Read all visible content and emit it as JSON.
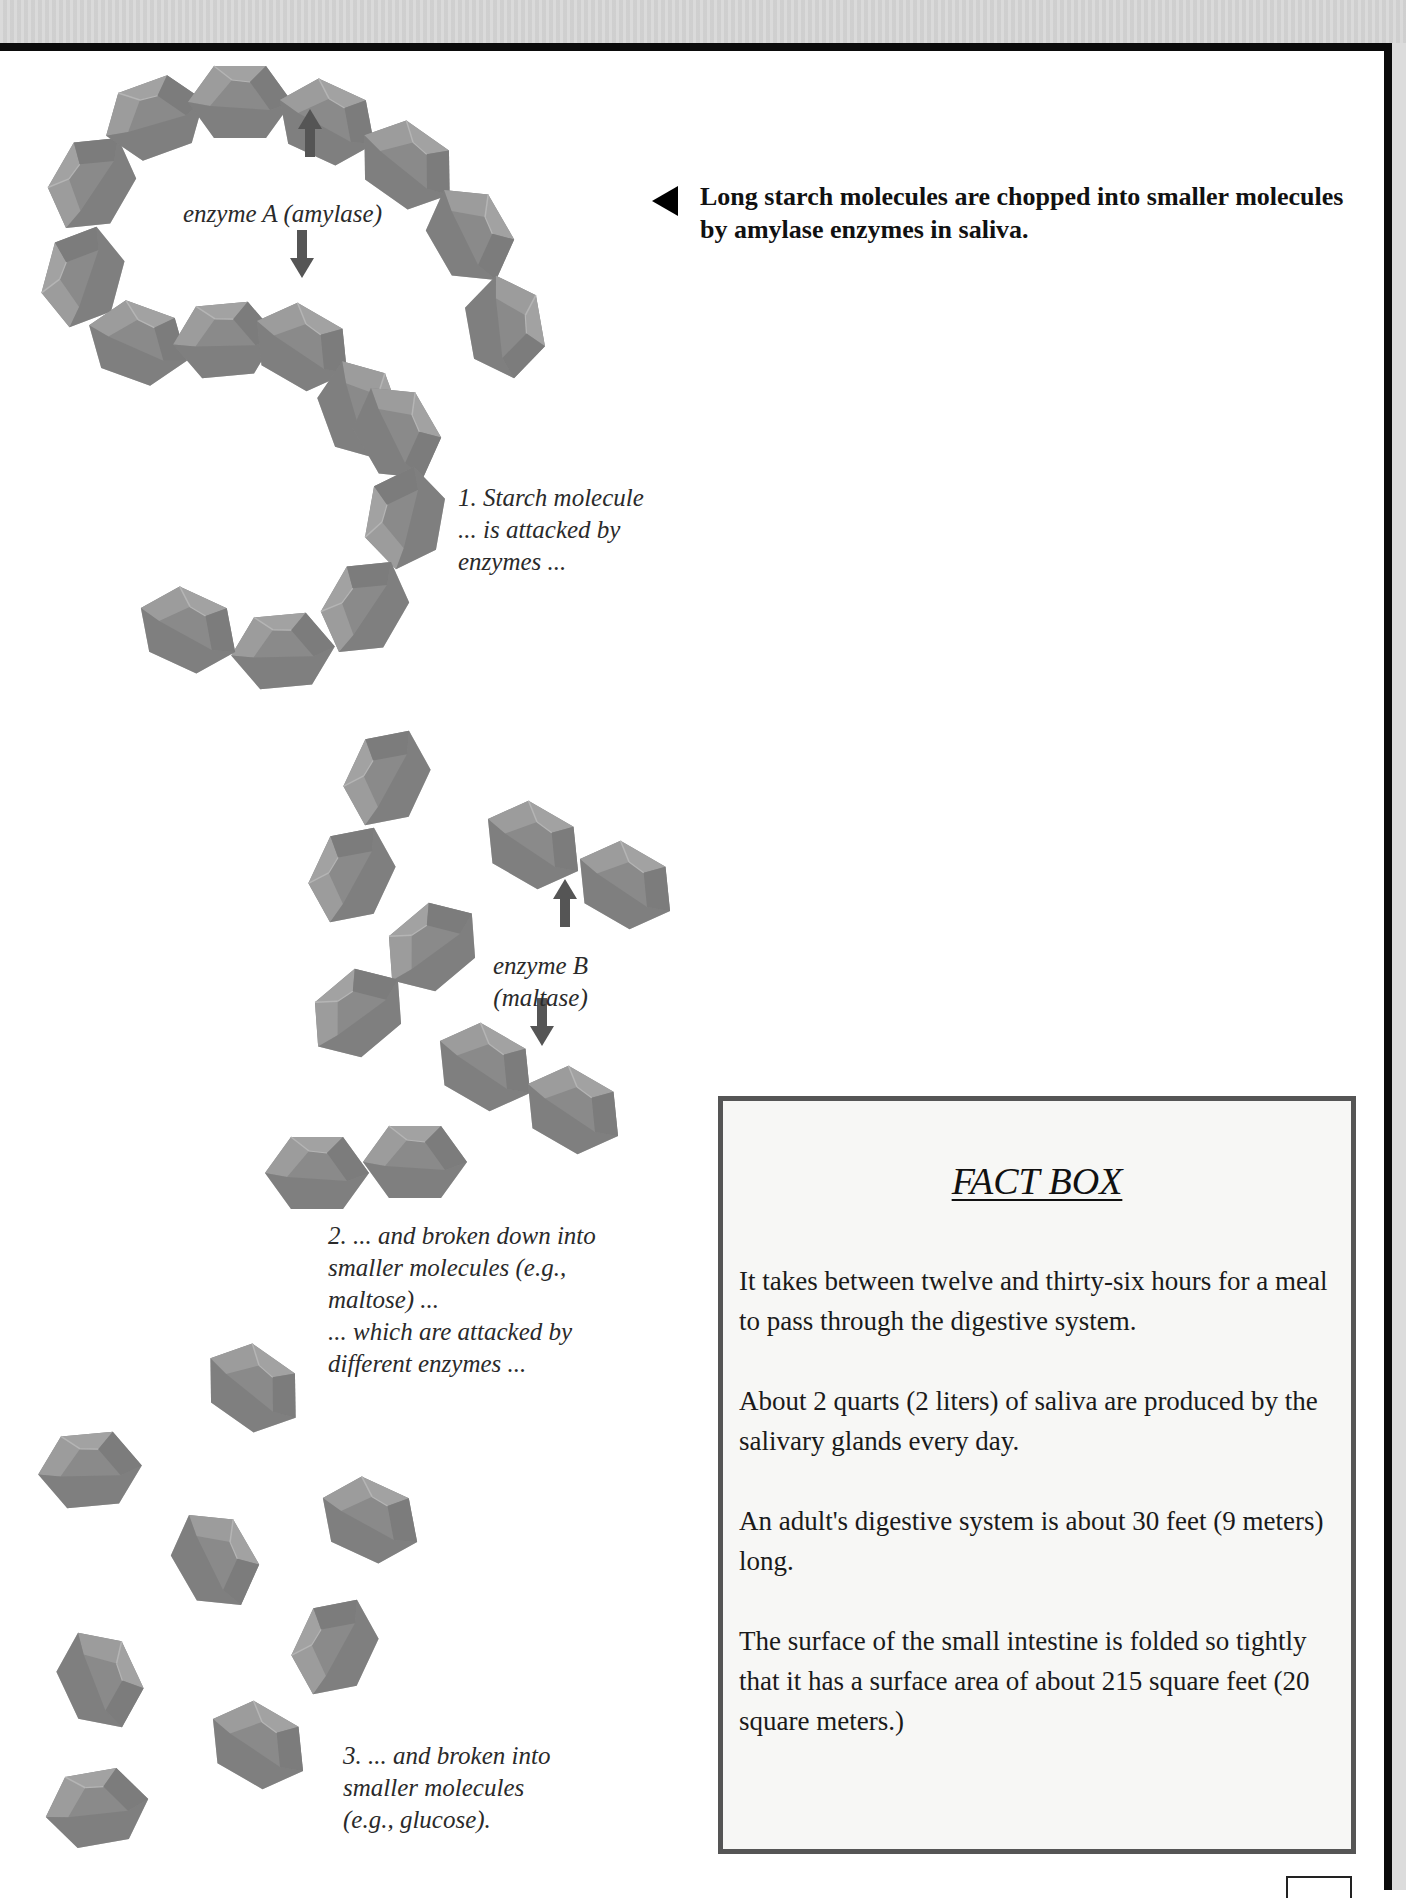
{
  "caption": {
    "text": "Long starch molecules are chopped into smaller molecules by amylase enzymes in saliva.",
    "pointer_icon": "left-triangle-icon"
  },
  "labels": {
    "enzyme_a": "enzyme A (amylase)",
    "step1": "1. Starch molecule\n... is attacked by\nenzymes ...",
    "enzyme_b": "enzyme B\n(maltase)",
    "step2": "2. ... and broken down into\nsmaller molecules (e.g.,\nmaltose) ...\n... which are attacked by\ndifferent enzymes ...",
    "step3": "3. ... and broken into\nsmaller molecules\n(e.g., glucose)."
  },
  "fact_box": {
    "title": "FACT BOX",
    "facts": [
      "It takes between twelve and thirty-six hours for a meal to pass through the digestive system.",
      "About 2 quarts (2 liters) of saliva are produced by the salivary glands every day.",
      "An adult's digestive system is about 30 feet (9 meters) long.",
      "The surface of the small intestine is folded so tightly that it has a surface area of about 215 square feet (20 square meters.)"
    ]
  },
  "colors": {
    "molecule_fill": "#8a8a8a",
    "molecule_dark": "#6e6e6e",
    "molecule_light": "#a4a4a4",
    "arrow": "#555555",
    "rule": "#0b0b0b"
  },
  "diagram": {
    "starch_chain": [
      {
        "x": 92,
        "y": 183,
        "r": -60
      },
      {
        "x": 155,
        "y": 118,
        "r": -20
      },
      {
        "x": 240,
        "y": 102,
        "r": 0
      },
      {
        "x": 327,
        "y": 122,
        "r": 25
      },
      {
        "x": 407,
        "y": 165,
        "r": 35
      },
      {
        "x": 470,
        "y": 235,
        "r": 60
      },
      {
        "x": 505,
        "y": 327,
        "r": 80
      },
      {
        "x": 83,
        "y": 277,
        "r": -75
      },
      {
        "x": 138,
        "y": 343,
        "r": 20
      },
      {
        "x": 225,
        "y": 340,
        "r": -5
      },
      {
        "x": 302,
        "y": 347,
        "r": 30
      },
      {
        "x": 360,
        "y": 410,
        "r": 70
      },
      {
        "x": 397,
        "y": 433,
        "r": 60
      },
      {
        "x": 405,
        "y": 518,
        "r": -80
      },
      {
        "x": 365,
        "y": 607,
        "r": -60
      },
      {
        "x": 283,
        "y": 651,
        "r": -5
      },
      {
        "x": 188,
        "y": 630,
        "r": 25
      }
    ],
    "maltose": [
      {
        "x": 387,
        "y": 778,
        "r": -65
      },
      {
        "x": 352,
        "y": 875,
        "r": -65
      },
      {
        "x": 432,
        "y": 947,
        "r": -40
      },
      {
        "x": 358,
        "y": 1013,
        "r": -40
      },
      {
        "x": 533,
        "y": 845,
        "r": 30
      },
      {
        "x": 625,
        "y": 885,
        "r": 30
      },
      {
        "x": 485,
        "y": 1067,
        "r": 30
      },
      {
        "x": 573,
        "y": 1110,
        "r": 30
      },
      {
        "x": 317,
        "y": 1173,
        "r": 0
      },
      {
        "x": 415,
        "y": 1162,
        "r": 0
      }
    ],
    "glucose": [
      {
        "x": 253,
        "y": 1388,
        "r": 35
      },
      {
        "x": 90,
        "y": 1470,
        "r": -5
      },
      {
        "x": 215,
        "y": 1560,
        "r": 60
      },
      {
        "x": 370,
        "y": 1520,
        "r": 25
      },
      {
        "x": 335,
        "y": 1647,
        "r": -65
      },
      {
        "x": 100,
        "y": 1680,
        "r": 65
      },
      {
        "x": 258,
        "y": 1745,
        "r": 30
      },
      {
        "x": 97,
        "y": 1808,
        "r": -10
      }
    ],
    "arrows": [
      {
        "name": "enzyme-a-up-arrow",
        "x": 310,
        "y": 135,
        "dir": "up"
      },
      {
        "name": "enzyme-a-down-arrow",
        "x": 302,
        "y": 252,
        "dir": "down"
      },
      {
        "name": "enzyme-b-up-arrow",
        "x": 565,
        "y": 905,
        "dir": "up"
      },
      {
        "name": "enzyme-b-down-arrow",
        "x": 542,
        "y": 1020,
        "dir": "down"
      }
    ]
  }
}
